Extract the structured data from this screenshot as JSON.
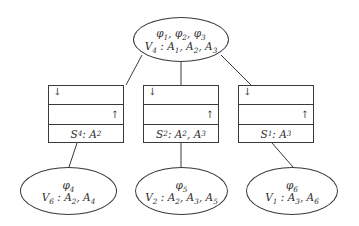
{
  "diagram": {
    "colors": {
      "stroke": "#3a3a3a",
      "background": "#ffffff",
      "text": "#2e2e2e"
    },
    "arrows": {
      "down": "↓",
      "up": "↑"
    },
    "root": {
      "potentials": "φ_1, φ_2, φ_3",
      "variables": "V_4 : A_1, A_2, A_3"
    },
    "separators": [
      {
        "label": "S_4 : A_2"
      },
      {
        "label": "S_2 : A_2, A_3"
      },
      {
        "label": "S_1 : A_3"
      }
    ],
    "leaves": [
      {
        "potentials": "φ_4",
        "variables": "V_6 : A_2, A_4"
      },
      {
        "potentials": "φ_5",
        "variables": "V_2 : A_2, A_3, A_5"
      },
      {
        "potentials": "φ_6",
        "variables": "V_1 : A_3, A_6"
      }
    ]
  }
}
